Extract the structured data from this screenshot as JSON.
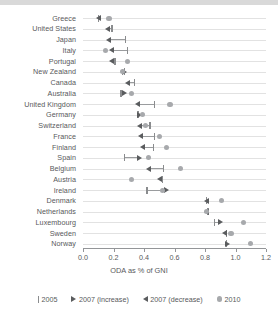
{
  "chart_data": {
    "type": "scatter",
    "title": "",
    "xlabel": "ODA as % of GNI",
    "ylabel": "",
    "xlim": [
      0.0,
      1.2
    ],
    "grid": true,
    "legend_position": "bottom",
    "xticks": [
      "0.0",
      "0.2",
      "0.4",
      "0.6",
      "0.8",
      "1.0",
      "1.2"
    ],
    "xtick_values": [
      0.0,
      0.2,
      0.4,
      0.6,
      0.8,
      1.0,
      1.2
    ],
    "categories": [
      "Greece",
      "United States",
      "Japan",
      "Italy",
      "Portugal",
      "New Zealand",
      "Canada",
      "Australia",
      "United Kingdom",
      "Germany",
      "Switzerland",
      "France",
      "Finland",
      "Spain",
      "Belgium",
      "Austria",
      "Ireland",
      "Denmark",
      "Netherlands",
      "Luxembourg",
      "Sweden",
      "Norway"
    ],
    "series": [
      {
        "name": "2005",
        "glyph": "tick",
        "values": [
          0.1,
          0.19,
          0.28,
          0.29,
          0.21,
          0.27,
          0.34,
          0.25,
          0.47,
          0.36,
          0.44,
          0.47,
          0.46,
          0.27,
          0.53,
          0.52,
          0.42,
          0.81,
          0.82,
          0.86,
          0.94,
          0.94
        ]
      },
      {
        "name": "2007 (increase)",
        "glyph": "triangle-right",
        "values": [
          null,
          null,
          null,
          null,
          null,
          0.27,
          null,
          0.27,
          null,
          0.37,
          null,
          null,
          null,
          0.37,
          null,
          null,
          0.55,
          null,
          null,
          0.9,
          null,
          0.95
        ]
      },
      {
        "name": "2007 (decrease)",
        "glyph": "triangle-left",
        "values": [
          0.1,
          0.16,
          0.17,
          0.19,
          0.19,
          null,
          0.29,
          null,
          0.36,
          null,
          0.37,
          0.38,
          0.39,
          null,
          0.43,
          0.5,
          null,
          0.81,
          0.81,
          null,
          0.93,
          null
        ]
      },
      {
        "name": "2010",
        "glyph": "circle",
        "values": [
          0.17,
          null,
          null,
          0.15,
          0.29,
          0.26,
          null,
          0.32,
          0.57,
          0.39,
          0.41,
          0.5,
          0.55,
          0.43,
          0.64,
          0.32,
          0.52,
          0.91,
          0.81,
          1.05,
          0.97,
          1.1
        ]
      }
    ],
    "legend": [
      {
        "label": "2005",
        "glyph": "tick"
      },
      {
        "label": "2007 (increase)",
        "glyph": "triangle-right"
      },
      {
        "label": "2007 (decrease)",
        "glyph": "triangle-left"
      },
      {
        "label": "2010",
        "glyph": "circle"
      }
    ],
    "colors": {
      "tick": "#8a8c8e",
      "triangle": "#5a5c5e",
      "circle": "#a7a9ac",
      "gridline": "#e2e2e2",
      "axis": "#939598",
      "text": "#58595b",
      "topbar": "#d9d9d9"
    }
  }
}
